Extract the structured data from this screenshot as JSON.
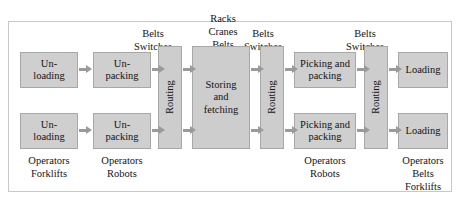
{
  "figure": {
    "name": "warehouse-process-flow",
    "background_color": "#ffffff",
    "box_fill_color": "#cfcfcf",
    "box_border_color": "#a8a8a8",
    "arrow_color": "#9a9a9a",
    "frame_color": "#c8c8c8",
    "text_color": "#141414"
  },
  "top_labels": [
    {
      "text": "Belts\nSwitches"
    },
    {
      "text": "Racks\nCranes\nBelts"
    },
    {
      "text": "Belts\nSwitches"
    },
    {
      "text": "Belts\nSwitches"
    }
  ],
  "bottom_labels": [
    {
      "text": "Operators\nForklifts"
    },
    {
      "text": "Operators\nRobots"
    },
    {
      "text": "Operators\nRobots"
    },
    {
      "text": "Operators\nBelts\nForklifts"
    }
  ],
  "nodes": {
    "unloading_top": "Un-\nloading",
    "unloading_bottom": "Un-\nloading",
    "unpacking_top": "Un-\npacking",
    "unpacking_bottom": "Un-\npacking",
    "routing_1": "Routing",
    "storing_and_fetching": "Storing\nand\nfetching",
    "routing_2": "Routing",
    "picking_packing_top": "Picking and\npacking",
    "picking_packing_bottom": "Picking and\npacking",
    "routing_3": "Routing",
    "loading_top": "Loading",
    "loading_bottom": "Loading"
  }
}
